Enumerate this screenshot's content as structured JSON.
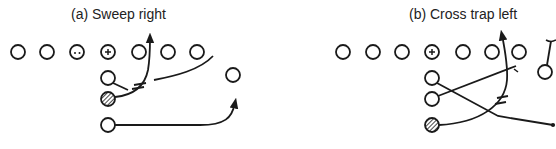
{
  "diagrams": [
    {
      "id": "a",
      "title": "(a) Sweep right",
      "line_players": [
        {
          "x": 18,
          "y": 52,
          "mark": "none"
        },
        {
          "x": 47,
          "y": 52,
          "mark": "none"
        },
        {
          "x": 77,
          "y": 52,
          "mark": "dots"
        },
        {
          "x": 108,
          "y": 52,
          "mark": "plus"
        },
        {
          "x": 139,
          "y": 52,
          "mark": "none"
        },
        {
          "x": 168,
          "y": 52,
          "mark": "none"
        },
        {
          "x": 197,
          "y": 52,
          "mark": "none"
        }
      ],
      "backs": [
        {
          "x": 108,
          "y": 78,
          "mark": "none"
        },
        {
          "x": 108,
          "y": 99,
          "mark": "hatched"
        },
        {
          "x": 108,
          "y": 125,
          "mark": "none"
        }
      ],
      "receivers": [
        {
          "x": 233,
          "y": 75,
          "mark": "none"
        }
      ]
    },
    {
      "id": "b",
      "title": "(b) Cross trap left",
      "line_players": [
        {
          "x": 343,
          "y": 52,
          "mark": "none"
        },
        {
          "x": 373,
          "y": 52,
          "mark": "none"
        },
        {
          "x": 402,
          "y": 52,
          "mark": "none"
        },
        {
          "x": 432,
          "y": 52,
          "mark": "plus"
        },
        {
          "x": 463,
          "y": 52,
          "mark": "none"
        },
        {
          "x": 492,
          "y": 52,
          "mark": "none"
        },
        {
          "x": 519,
          "y": 52,
          "mark": "none"
        }
      ],
      "backs": [
        {
          "x": 432,
          "y": 78,
          "mark": "none"
        },
        {
          "x": 432,
          "y": 99,
          "mark": "none"
        },
        {
          "x": 432,
          "y": 125,
          "mark": "hatched"
        }
      ],
      "receivers": [
        {
          "x": 545,
          "y": 72,
          "mark": "none"
        }
      ]
    }
  ],
  "colors": {
    "ink": "#1a1a1a",
    "background": "#ffffff"
  }
}
